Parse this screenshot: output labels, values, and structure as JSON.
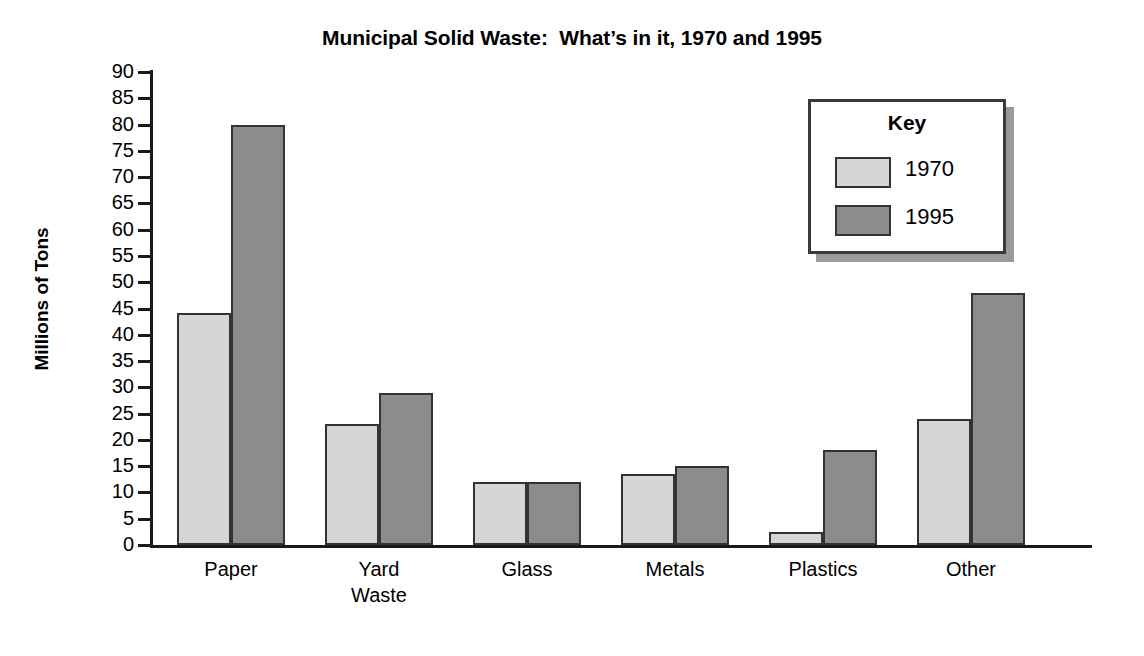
{
  "chart_data": {
    "type": "bar",
    "title": "Municipal Solid Waste:  What’s in it, 1970 and 1995",
    "xlabel": "",
    "ylabel": "Millions of Tons",
    "ylim": [
      0,
      90
    ],
    "ytick_step": 5,
    "yticks": [
      "90",
      "85",
      "80",
      "75",
      "70",
      "65",
      "60",
      "55",
      "50",
      "45",
      "40",
      "35",
      "30",
      "25",
      "20",
      "15",
      "10",
      "5",
      "0"
    ],
    "grid": false,
    "legend_position": "upper-right",
    "legend_title": "Key",
    "categories": [
      "Paper",
      "Yard\nWaste",
      "Glass",
      "Metals",
      "Plastics",
      "Other"
    ],
    "series": [
      {
        "name": "1970",
        "color": "#d6d6d6",
        "values": [
          44.2,
          23.0,
          12.0,
          13.5,
          2.5,
          24.0
        ]
      },
      {
        "name": "1995",
        "color": "#8c8c8c",
        "values": [
          80.0,
          29.0,
          12.0,
          15.0,
          18.0,
          48.0
        ]
      }
    ]
  },
  "colors": {
    "series_1970": "#d6d6d6",
    "series_1995": "#8c8c8c",
    "axis": "#1a1a1a",
    "bar_outline": "#333333",
    "background": "#ffffff",
    "legend_shadow": "#9a9a9a"
  }
}
